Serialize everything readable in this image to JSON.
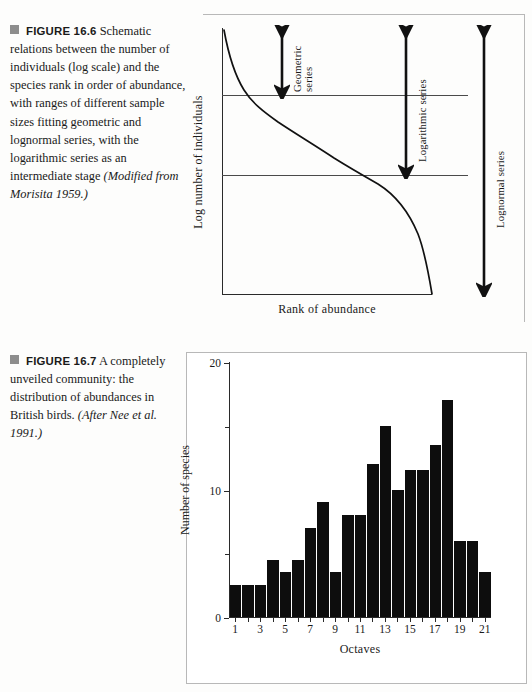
{
  "figure_1": {
    "bullet": "square-bullet",
    "label": "FIGURE 16.6",
    "caption_body": "Schematic relations between the number of individuals (log scale) and the species rank in order of abundance, with ranges of different sample sizes fitting geometric and lognormal series, with the logarithmic series as an intermediate stage ",
    "caption_source": "(Modified from Morisita 1959.)",
    "chart_data": {
      "type": "line",
      "title": "",
      "xlabel": "Rank of abundance",
      "ylabel": "Log number of individuals",
      "grid": false,
      "axis_ticks": false,
      "xlim": [
        0,
        100
      ],
      "ylim": [
        0,
        100
      ],
      "reference_lines_y": [
        75,
        45
      ],
      "series": [
        {
          "name": "rank-abundance curve",
          "x": [
            0,
            2,
            4,
            7,
            11,
            16,
            22,
            30,
            40,
            50,
            60,
            70,
            78,
            85,
            90,
            94,
            97,
            99,
            100
          ],
          "y": [
            100,
            92,
            84,
            77,
            72,
            68,
            64,
            60,
            56,
            52,
            48,
            44,
            40,
            34,
            27,
            19,
            12,
            6,
            0
          ]
        }
      ],
      "annotations": [
        {
          "name": "Geometric series",
          "type": "double-arrow",
          "y_from": 100,
          "y_to": 75,
          "x": 28
        },
        {
          "name": "Logarithmic series",
          "type": "double-arrow",
          "y_from": 100,
          "y_to": 45,
          "x": 73
        },
        {
          "name": "Lognormal series",
          "type": "double-arrow",
          "y_from": 100,
          "y_to": 0,
          "x": 103
        }
      ]
    }
  },
  "figure_2": {
    "bullet": "square-bullet",
    "label": "FIGURE 16.7",
    "caption_body": "A completely unveiled community: the distribution of abundances in British birds. ",
    "caption_source": "(After Nee et al. 1991.)",
    "chart_data": {
      "type": "bar",
      "title": "",
      "xlabel": "Octaves",
      "ylabel": "Number of species",
      "grid": false,
      "ylim": [
        0,
        20
      ],
      "y_major_ticks": [
        0,
        10,
        20
      ],
      "y_major_tick_labels": [
        "0",
        "10",
        "20"
      ],
      "y_minor_ticks": [
        5,
        15
      ],
      "x_tick_labels": [
        "1",
        "3",
        "5",
        "7",
        "9",
        "11",
        "13",
        "15",
        "17",
        "19",
        "21"
      ],
      "categories": [
        1,
        2,
        3,
        4,
        5,
        6,
        7,
        8,
        9,
        10,
        11,
        12,
        13,
        14,
        15,
        16,
        17,
        18,
        19,
        20,
        21
      ],
      "values": [
        2.5,
        2.5,
        2.5,
        4.5,
        3.5,
        4.5,
        7.0,
        9.0,
        3.5,
        8.0,
        8.0,
        12.0,
        15.0,
        10.0,
        11.5,
        11.5,
        13.5,
        17.0,
        6.0,
        6.0,
        3.5
      ],
      "bar_color": "#0d0d0d"
    }
  }
}
